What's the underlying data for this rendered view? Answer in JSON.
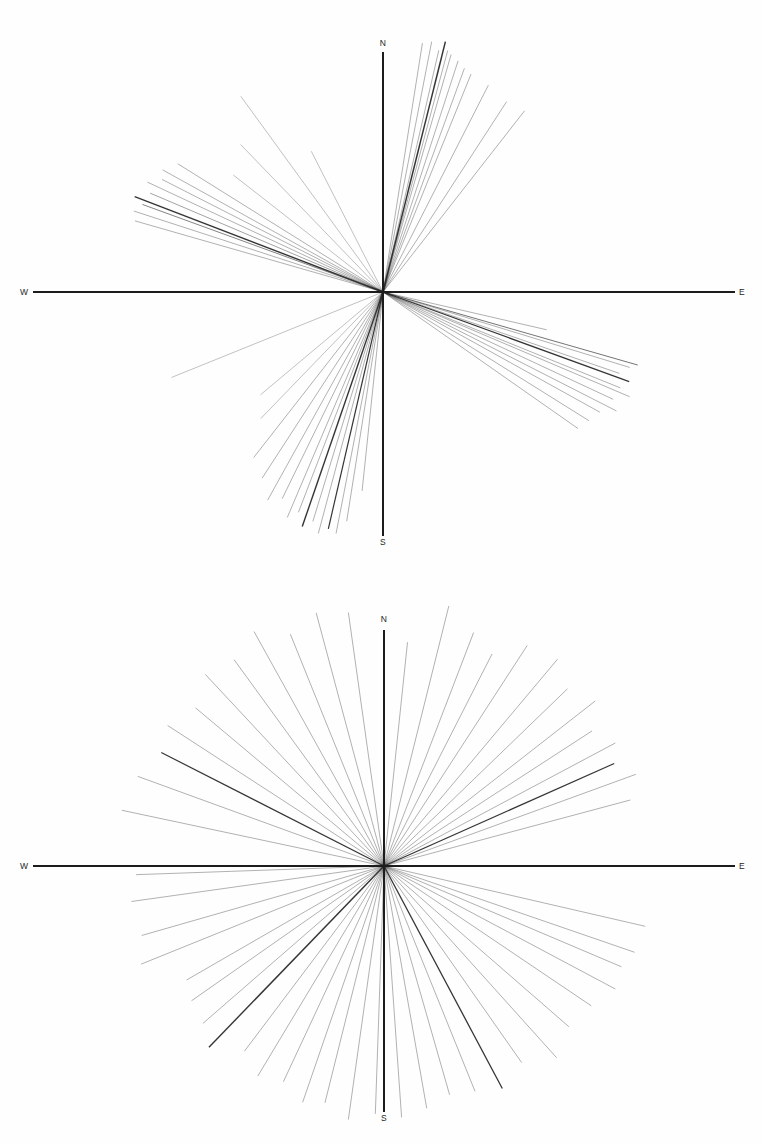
{
  "figure": {
    "background_color": "#fefefe",
    "ink_color": "#2a2a2a",
    "axis_color": "#1c1c1c",
    "caption_partial": ""
  },
  "panels": [
    {
      "id": "panel-top",
      "name": "upper-ray-diagram",
      "center": {
        "x": 383,
        "y": 292
      },
      "axes": {
        "horizontal": {
          "x1": 33,
          "x2": 735,
          "y": 292
        },
        "vertical": {
          "y1": 52,
          "y2": 536,
          "x": 383
        }
      },
      "labels": {
        "north": "N",
        "south": "S",
        "east": "E",
        "west": "W"
      },
      "label_positions": {
        "north": {
          "x": 383,
          "y": 46
        },
        "south": {
          "x": 383,
          "y": 545
        },
        "east": {
          "x": 742,
          "y": 295
        },
        "west": {
          "x": 24,
          "y": 295
        }
      }
    },
    {
      "id": "panel-bottom",
      "name": "lower-ray-diagram",
      "center": {
        "x": 384,
        "y": 294
      },
      "axes": {
        "horizontal": {
          "x1": 33,
          "x2": 735,
          "y": 294
        },
        "vertical": {
          "y1": 58,
          "y2": 540,
          "x": 384
        }
      },
      "labels": {
        "north": "N",
        "south": "S",
        "east": "E",
        "west": "W"
      },
      "label_positions": {
        "north": {
          "x": 384,
          "y": 50
        },
        "south": {
          "x": 384,
          "y": 549
        },
        "east": {
          "x": 742,
          "y": 297
        },
        "west": {
          "x": 24,
          "y": 297
        }
      }
    }
  ],
  "chart_data": [
    {
      "type": "scatter",
      "name": "upper-ray-diagram",
      "title": "",
      "xlabel": "",
      "ylabel": "",
      "description": "Radial ray (lineament orientation) diagram; each ray drawn from the origin at a compass azimuth with a given length. Azimuth measured clockwise from North in degrees.",
      "axis_labels": [
        "N",
        "E",
        "S",
        "W"
      ],
      "grid": false,
      "legend": "none",
      "units": {
        "azimuth": "degrees clockwise from North",
        "length": "pixels from origin"
      },
      "rays": [
        {
          "azimuth": 9,
          "length": 252,
          "weight": 0.5
        },
        {
          "azimuth": 11,
          "length": 255,
          "weight": 0.5
        },
        {
          "azimuth": 13,
          "length": 248,
          "weight": 0.5
        },
        {
          "azimuth": 14,
          "length": 258,
          "weight": 1.5
        },
        {
          "azimuth": 15,
          "length": 250,
          "weight": 0.5
        },
        {
          "azimuth": 16,
          "length": 247,
          "weight": 0.5
        },
        {
          "azimuth": 18,
          "length": 243,
          "weight": 0.5
        },
        {
          "azimuth": 20,
          "length": 238,
          "weight": 0.5
        },
        {
          "azimuth": 22,
          "length": 235,
          "weight": 0.5
        },
        {
          "azimuth": 27,
          "length": 232,
          "weight": 0.5
        },
        {
          "azimuth": 33,
          "length": 227,
          "weight": 0.5
        },
        {
          "azimuth": 38,
          "length": 230,
          "weight": 0.5
        },
        {
          "azimuth": 103,
          "length": 168,
          "weight": 0.5
        },
        {
          "azimuth": 106,
          "length": 265,
          "weight": 0.9
        },
        {
          "azimuth": 107,
          "length": 258,
          "weight": 0.5
        },
        {
          "azimuth": 109,
          "length": 250,
          "weight": 0.5
        },
        {
          "azimuth": 110,
          "length": 262,
          "weight": 1.2
        },
        {
          "azimuth": 112,
          "length": 256,
          "weight": 0.5
        },
        {
          "azimuth": 113,
          "length": 268,
          "weight": 0.5
        },
        {
          "azimuth": 115,
          "length": 254,
          "weight": 0.5
        },
        {
          "azimuth": 117,
          "length": 262,
          "weight": 0.5
        },
        {
          "azimuth": 119,
          "length": 248,
          "weight": 0.5
        },
        {
          "azimuth": 122,
          "length": 243,
          "weight": 0.5
        },
        {
          "azimuth": 125,
          "length": 238,
          "weight": 0.5
        },
        {
          "azimuth": 186,
          "length": 200,
          "weight": 0.5
        },
        {
          "azimuth": 189,
          "length": 232,
          "weight": 0.5
        },
        {
          "azimuth": 191,
          "length": 246,
          "weight": 0.5
        },
        {
          "azimuth": 193,
          "length": 243,
          "weight": 1.2
        },
        {
          "azimuth": 195,
          "length": 250,
          "weight": 0.5
        },
        {
          "azimuth": 197,
          "length": 240,
          "weight": 0.5
        },
        {
          "azimuth": 199,
          "length": 248,
          "weight": 1.4
        },
        {
          "azimuth": 201,
          "length": 236,
          "weight": 0.5
        },
        {
          "azimuth": 203,
          "length": 245,
          "weight": 0.5
        },
        {
          "azimuth": 206,
          "length": 230,
          "weight": 0.5
        },
        {
          "azimuth": 209,
          "length": 238,
          "weight": 0.5
        },
        {
          "azimuth": 213,
          "length": 222,
          "weight": 0.5
        },
        {
          "azimuth": 218,
          "length": 210,
          "weight": 0.5
        },
        {
          "azimuth": 224,
          "length": 176,
          "weight": 0.4
        },
        {
          "azimuth": 230,
          "length": 160,
          "weight": 0.4
        },
        {
          "azimuth": 286,
          "length": 258,
          "weight": 0.5
        },
        {
          "azimuth": 288,
          "length": 262,
          "weight": 0.5
        },
        {
          "azimuth": 290,
          "length": 256,
          "weight": 0.8
        },
        {
          "azimuth": 291,
          "length": 266,
          "weight": 1.4
        },
        {
          "azimuth": 293,
          "length": 253,
          "weight": 0.6
        },
        {
          "azimuth": 295,
          "length": 260,
          "weight": 0.5
        },
        {
          "azimuth": 297,
          "length": 248,
          "weight": 0.5
        },
        {
          "azimuth": 299,
          "length": 252,
          "weight": 0.5
        },
        {
          "azimuth": 302,
          "length": 242,
          "weight": 0.5
        },
        {
          "azimuth": 308,
          "length": 190,
          "weight": 0.4
        },
        {
          "azimuth": 316,
          "length": 205,
          "weight": 0.4
        },
        {
          "azimuth": 324,
          "length": 242,
          "weight": 0.4
        },
        {
          "azimuth": 333,
          "length": 158,
          "weight": 0.4
        },
        {
          "azimuth": 248,
          "length": 228,
          "weight": 0.4
        }
      ]
    },
    {
      "type": "scatter",
      "name": "lower-ray-diagram",
      "title": "",
      "xlabel": "",
      "ylabel": "",
      "description": "Radial ray (lineament orientation) diagram with rays distributed broadly across all quadrants. Azimuth measured clockwise from North in degrees.",
      "axis_labels": [
        "N",
        "E",
        "S",
        "W"
      ],
      "grid": false,
      "legend": "none",
      "units": {
        "azimuth": "degrees clockwise from North",
        "length": "pixels from origin"
      },
      "rays": [
        {
          "azimuth": 6,
          "length": 225,
          "weight": 0.5
        },
        {
          "azimuth": 14,
          "length": 268,
          "weight": 0.5
        },
        {
          "azimuth": 21,
          "length": 250,
          "weight": 0.5
        },
        {
          "azimuth": 27,
          "length": 238,
          "weight": 0.5
        },
        {
          "azimuth": 33,
          "length": 263,
          "weight": 0.5
        },
        {
          "azimuth": 40,
          "length": 270,
          "weight": 0.5
        },
        {
          "azimuth": 46,
          "length": 255,
          "weight": 0.5
        },
        {
          "azimuth": 52,
          "length": 268,
          "weight": 0.5
        },
        {
          "azimuth": 57,
          "length": 248,
          "weight": 0.5
        },
        {
          "azimuth": 62,
          "length": 262,
          "weight": 0.5
        },
        {
          "azimuth": 66,
          "length": 252,
          "weight": 1.3
        },
        {
          "azimuth": 70,
          "length": 268,
          "weight": 0.5
        },
        {
          "azimuth": 75,
          "length": 255,
          "weight": 0.5
        },
        {
          "azimuth": 103,
          "length": 268,
          "weight": 0.5
        },
        {
          "azimuth": 109,
          "length": 265,
          "weight": 0.5
        },
        {
          "azimuth": 113,
          "length": 258,
          "weight": 0.5
        },
        {
          "azimuth": 118,
          "length": 262,
          "weight": 0.5
        },
        {
          "azimuth": 124,
          "length": 250,
          "weight": 0.5
        },
        {
          "azimuth": 131,
          "length": 245,
          "weight": 0.5
        },
        {
          "azimuth": 138,
          "length": 258,
          "weight": 0.5
        },
        {
          "azimuth": 145,
          "length": 240,
          "weight": 0.5
        },
        {
          "azimuth": 152,
          "length": 252,
          "weight": 1.3
        },
        {
          "azimuth": 158,
          "length": 243,
          "weight": 0.5
        },
        {
          "azimuth": 164,
          "length": 238,
          "weight": 0.5
        },
        {
          "azimuth": 170,
          "length": 246,
          "weight": 0.5
        },
        {
          "azimuth": 176,
          "length": 252,
          "weight": 0.5
        },
        {
          "azimuth": 182,
          "length": 248,
          "weight": 0.5
        },
        {
          "azimuth": 188,
          "length": 256,
          "weight": 0.5
        },
        {
          "azimuth": 194,
          "length": 244,
          "weight": 0.5
        },
        {
          "azimuth": 199,
          "length": 250,
          "weight": 0.5
        },
        {
          "azimuth": 205,
          "length": 238,
          "weight": 0.5
        },
        {
          "azimuth": 211,
          "length": 245,
          "weight": 0.5
        },
        {
          "azimuth": 217,
          "length": 232,
          "weight": 0.5
        },
        {
          "azimuth": 224,
          "length": 252,
          "weight": 1.4
        },
        {
          "azimuth": 229,
          "length": 240,
          "weight": 0.5
        },
        {
          "azimuth": 235,
          "length": 235,
          "weight": 0.5
        },
        {
          "azimuth": 240,
          "length": 228,
          "weight": 0.5
        },
        {
          "azimuth": 248,
          "length": 262,
          "weight": 0.5
        },
        {
          "azimuth": 254,
          "length": 252,
          "weight": 0.5
        },
        {
          "azimuth": 262,
          "length": 255,
          "weight": 0.5
        },
        {
          "azimuth": 268,
          "length": 248,
          "weight": 0.5
        },
        {
          "azimuth": 282,
          "length": 268,
          "weight": 0.5
        },
        {
          "azimuth": 290,
          "length": 262,
          "weight": 0.5
        },
        {
          "azimuth": 297,
          "length": 250,
          "weight": 1.2
        },
        {
          "azimuth": 303,
          "length": 258,
          "weight": 0.5
        },
        {
          "azimuth": 310,
          "length": 246,
          "weight": 0.5
        },
        {
          "azimuth": 317,
          "length": 262,
          "weight": 0.5
        },
        {
          "azimuth": 324,
          "length": 255,
          "weight": 0.5
        },
        {
          "azimuth": 331,
          "length": 268,
          "weight": 0.5
        },
        {
          "azimuth": 338,
          "length": 250,
          "weight": 0.5
        },
        {
          "azimuth": 345,
          "length": 262,
          "weight": 0.5
        },
        {
          "azimuth": 352,
          "length": 256,
          "weight": 0.5
        }
      ]
    }
  ]
}
